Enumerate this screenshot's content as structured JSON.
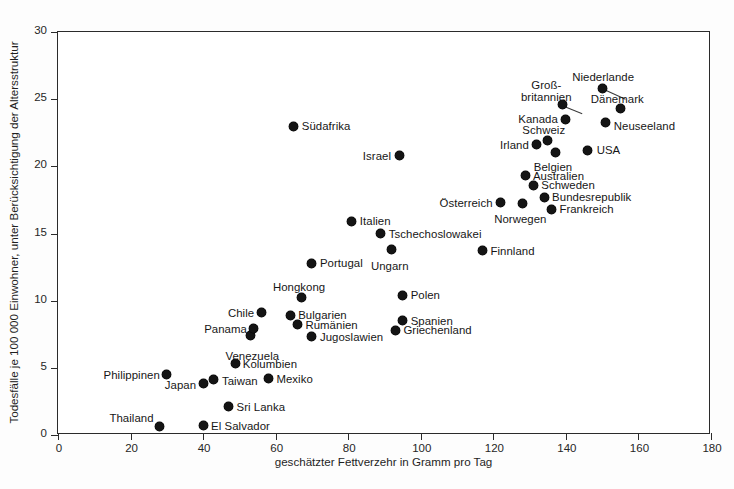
{
  "chart_data": {
    "type": "scatter",
    "title": "",
    "xlabel": "geschätzter Fettverzehr in Gramm pro Tag",
    "ylabel": "Todesfälle je 100 000 Einwohner, unter Berücksichtigung der Altersstruktur",
    "xlim": [
      0,
      180
    ],
    "ylim": [
      0,
      30
    ],
    "xticks": [
      0,
      20,
      40,
      60,
      80,
      100,
      120,
      140,
      160,
      180
    ],
    "yticks": [
      0,
      5,
      10,
      15,
      20,
      25,
      30
    ],
    "grid": false,
    "legend": "none",
    "marker_color": "#141414",
    "points": [
      {
        "label": "Thailand",
        "x": 28,
        "y": 0.6,
        "lx": -6,
        "ly": -15,
        "anchor": "end",
        "lines": 1
      },
      {
        "label": "El Salvador",
        "x": 40,
        "y": 0.7,
        "lx": 8,
        "ly": -6,
        "anchor": "start",
        "lines": 1
      },
      {
        "label": "Philippinen",
        "x": 30,
        "y": 4.5,
        "lx": -7,
        "ly": -6,
        "anchor": "end",
        "lines": 1
      },
      {
        "label": "Japan",
        "x": 40,
        "y": 3.8,
        "lx": -7,
        "ly": -5,
        "anchor": "end",
        "lines": 1
      },
      {
        "label": "Taiwan",
        "x": 43,
        "y": 4.1,
        "lx": 8,
        "ly": -5,
        "anchor": "start",
        "lines": 1
      },
      {
        "label": "Sri Lanka",
        "x": 47,
        "y": 2.1,
        "lx": 8,
        "ly": -6,
        "anchor": "start",
        "lines": 1
      },
      {
        "label": "Mexiko",
        "x": 58,
        "y": 4.2,
        "lx": 8,
        "ly": -6,
        "anchor": "start",
        "lines": 1
      },
      {
        "label": "Kolumbien",
        "x": 49,
        "y": 5.3,
        "lx": 7,
        "ly": -6,
        "anchor": "start",
        "lines": 1
      },
      {
        "label": "Venezuela",
        "x": 53,
        "y": 7.4,
        "lx": 2,
        "ly": 14,
        "anchor": "mid",
        "lines": 1
      },
      {
        "label": "Panama",
        "x": 54,
        "y": 7.9,
        "lx": -7,
        "ly": -6,
        "anchor": "end",
        "lines": 1
      },
      {
        "label": "Chile",
        "x": 56,
        "y": 9.1,
        "lx": -7,
        "ly": -6,
        "anchor": "end",
        "lines": 1
      },
      {
        "label": "Bulgarien",
        "x": 64,
        "y": 8.9,
        "lx": 8,
        "ly": -6,
        "anchor": "start",
        "lines": 1
      },
      {
        "label": "Rumänien",
        "x": 66,
        "y": 8.2,
        "lx": 8,
        "ly": -6,
        "anchor": "start",
        "lines": 1
      },
      {
        "label": "Jugoslawien",
        "x": 70,
        "y": 7.3,
        "lx": 8,
        "ly": -6,
        "anchor": "start",
        "lines": 1
      },
      {
        "label": "Hongkong",
        "x": 67,
        "y": 10.2,
        "lx": -2,
        "ly": -17,
        "anchor": "mid",
        "lines": 1
      },
      {
        "label": "Portugal",
        "x": 70,
        "y": 12.8,
        "lx": 8,
        "ly": -6,
        "anchor": "start",
        "lines": 1
      },
      {
        "label": "Spanien",
        "x": 95,
        "y": 8.5,
        "lx": 8,
        "ly": -6,
        "anchor": "start",
        "lines": 1
      },
      {
        "label": "Griechenland",
        "x": 93,
        "y": 7.8,
        "lx": 8,
        "ly": -6,
        "anchor": "start",
        "lines": 1
      },
      {
        "label": "Polen",
        "x": 95,
        "y": 10.4,
        "lx": 8,
        "ly": -6,
        "anchor": "start",
        "lines": 1
      },
      {
        "label": "Ungarn",
        "x": 92,
        "y": 13.8,
        "lx": -2,
        "ly": 10,
        "anchor": "mid",
        "lines": 1
      },
      {
        "label": "Tschechoslowakei",
        "x": 89,
        "y": 15.0,
        "lx": 8,
        "ly": -6,
        "anchor": "start",
        "lines": 1
      },
      {
        "label": "Italien",
        "x": 81,
        "y": 15.9,
        "lx": 8,
        "ly": -6,
        "anchor": "start",
        "lines": 1
      },
      {
        "label": "Finnland",
        "x": 117,
        "y": 13.7,
        "lx": 8,
        "ly": -6,
        "anchor": "start",
        "lines": 1
      },
      {
        "label": "Israel",
        "x": 94,
        "y": 20.8,
        "lx": -8,
        "ly": -6,
        "anchor": "end",
        "lines": 1
      },
      {
        "label": "Südafrika",
        "x": 65,
        "y": 23.0,
        "lx": 8,
        "ly": -6,
        "anchor": "start",
        "lines": 1
      },
      {
        "label": "Norwegen",
        "x": 128,
        "y": 17.2,
        "lx": -2,
        "ly": 9,
        "anchor": "mid",
        "lines": 1
      },
      {
        "label": "Österreich",
        "x": 122,
        "y": 17.3,
        "lx": -8,
        "ly": -6,
        "anchor": "end",
        "lines": 1
      },
      {
        "label": "Frankreich",
        "x": 136,
        "y": 16.8,
        "lx": 8,
        "ly": -6,
        "anchor": "start",
        "lines": 1
      },
      {
        "label": "Bundesrepublik",
        "x": 134,
        "y": 17.7,
        "lx": 8,
        "ly": -6,
        "anchor": "start",
        "lines": 1
      },
      {
        "label": "Schweden",
        "x": 131,
        "y": 18.6,
        "lx": 8,
        "ly": -6,
        "anchor": "start",
        "lines": 1
      },
      {
        "label": "Australien",
        "x": 129,
        "y": 19.3,
        "lx": 7,
        "ly": -6,
        "anchor": "start",
        "lines": 1
      },
      {
        "label": "Belgien",
        "x": 137,
        "y": 21.0,
        "lx": -2,
        "ly": 8,
        "anchor": "mid",
        "lines": 1
      },
      {
        "label": "Irland",
        "x": 132,
        "y": 21.6,
        "lx": -8,
        "ly": -6,
        "anchor": "end",
        "lines": 1
      },
      {
        "label": "Schweiz",
        "x": 135,
        "y": 21.9,
        "lx": -4,
        "ly": -17,
        "anchor": "mid",
        "lines": 1
      },
      {
        "label": "USA",
        "x": 146,
        "y": 21.2,
        "lx": 9,
        "ly": -6,
        "anchor": "start",
        "lines": 1
      },
      {
        "label": "Kanada",
        "x": 140,
        "y": 23.5,
        "lx": -8,
        "ly": -6,
        "anchor": "end",
        "lines": 1
      },
      {
        "label": "Neuseeland",
        "x": 151,
        "y": 23.3,
        "lx": 8,
        "ly": -2,
        "anchor": "start",
        "lines": 1
      },
      {
        "label": "Dänemark",
        "x": 155,
        "y": 24.3,
        "lx": -3,
        "ly": -16,
        "anchor": "mid",
        "lines": 1
      },
      {
        "label": "Groß-britannien",
        "x": 139,
        "y": 24.6,
        "lx": -16,
        "ly": -26,
        "anchor": "mid",
        "lines": 2
      },
      {
        "label": "Niederlande",
        "x": 150,
        "y": 25.8,
        "lx": 1,
        "ly": -17,
        "anchor": "mid",
        "lines": 1
      }
    ],
    "leaders": [
      {
        "from_x": 139,
        "from_y": 24.6,
        "to_x": 144.5,
        "to_y": 24.0
      },
      {
        "from_x": 150,
        "from_y": 25.8,
        "to_x": 156.5,
        "to_y": 25.0
      }
    ]
  },
  "caption": {
    "text": ""
  }
}
